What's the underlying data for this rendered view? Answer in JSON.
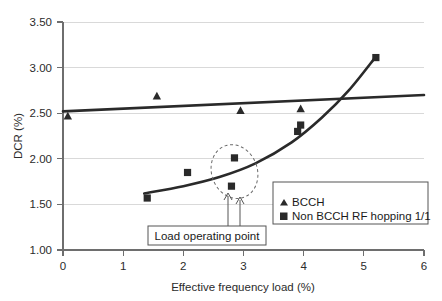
{
  "chart_data": {
    "type": "scatter",
    "title": "",
    "subtitle": "",
    "xlabel": "Effective frequency load (%)",
    "ylabel": "DCR (%)",
    "xlim": [
      0,
      6
    ],
    "ylim": [
      1.0,
      3.5
    ],
    "xticks": [
      "0",
      "1",
      "2",
      "3",
      "4",
      "5",
      "6"
    ],
    "xtick_values": [
      0,
      1,
      2,
      3,
      4,
      5,
      6
    ],
    "yticks": [
      "1.00",
      "1.50",
      "2.00",
      "2.50",
      "3.00",
      "3.50"
    ],
    "ytick_values": [
      1.0,
      1.5,
      2.0,
      2.5,
      3.0,
      3.5
    ],
    "grid": "horizontal",
    "legend_position": "inside-bottom-right",
    "series": [
      {
        "name": "BCCH",
        "marker": "triangle",
        "color": "#2a2a2a",
        "points": [
          {
            "x": 0.08,
            "y": 2.47
          },
          {
            "x": 1.56,
            "y": 2.69
          },
          {
            "x": 2.95,
            "y": 2.53
          },
          {
            "x": 3.95,
            "y": 2.55
          }
        ],
        "trendline": {
          "type": "linear",
          "from": {
            "x": 0.0,
            "y": 2.52
          },
          "to": {
            "x": 6.0,
            "y": 2.7
          }
        }
      },
      {
        "name": "Non BCCH RF hopping 1/1",
        "marker": "square",
        "color": "#2a2a2a",
        "points": [
          {
            "x": 1.4,
            "y": 1.57
          },
          {
            "x": 2.07,
            "y": 1.85
          },
          {
            "x": 2.8,
            "y": 1.7
          },
          {
            "x": 2.85,
            "y": 2.01
          },
          {
            "x": 3.9,
            "y": 2.3
          },
          {
            "x": 3.95,
            "y": 2.37
          },
          {
            "x": 5.2,
            "y": 3.11
          }
        ],
        "trendline": {
          "type": "polynomial",
          "points": [
            {
              "x": 1.35,
              "y": 1.62
            },
            {
              "x": 2.0,
              "y": 1.7
            },
            {
              "x": 2.6,
              "y": 1.8
            },
            {
              "x": 3.2,
              "y": 1.95
            },
            {
              "x": 3.8,
              "y": 2.18
            },
            {
              "x": 4.3,
              "y": 2.45
            },
            {
              "x": 4.75,
              "y": 2.75
            },
            {
              "x": 5.2,
              "y": 3.12
            }
          ]
        }
      }
    ],
    "annotations": [
      {
        "name": "load-operating-point",
        "label": "Load operating point",
        "targets": [
          {
            "x": 2.8,
            "y": 1.7
          },
          {
            "x": 2.85,
            "y": 2.01
          }
        ],
        "highlight": {
          "shape": "ellipse",
          "center_x": 2.85,
          "center_y": 1.86,
          "radius_x": 0.38,
          "radius_y": 0.3,
          "rotation": -20
        }
      }
    ]
  },
  "legend": {
    "entries": [
      {
        "marker": "triangle-icon",
        "label": "BCCH"
      },
      {
        "marker": "square-icon",
        "label": "Non BCCH RF hopping 1/1"
      }
    ]
  },
  "axes": {
    "y_title": "DCR (%)",
    "x_title": "Effective frequency load (%)",
    "y_tick_labels": [
      "3.50",
      "3.00",
      "2.50",
      "2.00",
      "1.50",
      "1.00"
    ],
    "x_tick_labels": [
      "0",
      "1",
      "2",
      "3",
      "4",
      "5",
      "6"
    ]
  },
  "annotation": {
    "label": "Load operating point"
  },
  "colors": {
    "series": "#2a2a2a",
    "grid": "#d9d9d9",
    "axis": "#6e6e6e",
    "background": "#ffffff",
    "callout_border": "#555555"
  }
}
